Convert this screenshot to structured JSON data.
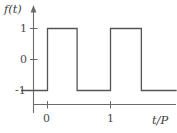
{
  "figure": {
    "name": "square-wave-plot",
    "background_color": "#ffffff",
    "line_color": "#555555",
    "axis_color": "#6b6b6b"
  },
  "axes": {
    "y_title": "f(t)",
    "x_title": "t/P",
    "y_ticks": [
      "1",
      "0",
      "-1"
    ],
    "x_ticks": [
      "0",
      "1"
    ]
  },
  "chart_data": {
    "type": "line",
    "title": "",
    "xlabel": "t/P",
    "ylabel": "f(t)",
    "xlim": [
      -0.42,
      2.05
    ],
    "ylim": [
      -1.55,
      1.45
    ],
    "grid": false,
    "legend": null,
    "xtick_labels": [
      "0",
      "1"
    ],
    "xtick_values": [
      0,
      1
    ],
    "ytick_labels": [
      "1",
      "0",
      "-1"
    ],
    "ytick_values": [
      1,
      0,
      -1
    ],
    "series": [
      {
        "name": "f(t)",
        "x": [
          -0.42,
          0.0,
          0.0,
          0.47,
          0.47,
          1.0,
          1.0,
          1.49,
          1.49,
          2.05
        ],
        "y": [
          -1,
          -1,
          1,
          1,
          -1,
          -1,
          1,
          1,
          -1,
          -1
        ]
      }
    ]
  }
}
